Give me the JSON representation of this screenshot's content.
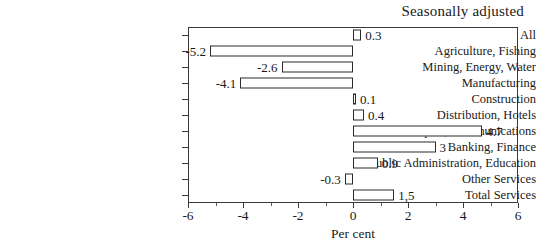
{
  "chart_data": {
    "type": "bar",
    "orientation": "horizontal",
    "title": "Seasonally adjusted",
    "xlabel": "Per cent",
    "ylabel": "",
    "xlim": [
      -6,
      6
    ],
    "grid": false,
    "legend": null,
    "xticks": [
      -6,
      -4,
      -2,
      0,
      2,
      4,
      6
    ],
    "xtick_labels": [
      "-6",
      "-4",
      "-2",
      "0",
      "2",
      "4",
      "6"
    ],
    "xticks_minor": [
      -5,
      -3,
      -1,
      1,
      3,
      5
    ],
    "categories": [
      "All",
      "Agriculture, Fishing",
      "Mining, Energy, Water",
      "Manufacturing",
      "Construction",
      "Distribution, Hotels",
      "Transport, Communications",
      "Banking, Finance",
      "Public Administration, Education",
      "Other Services",
      "Total Services"
    ],
    "values": [
      0.3,
      -5.2,
      -2.6,
      -4.1,
      0.1,
      0.4,
      4.7,
      3,
      0.9,
      -0.3,
      1.5
    ],
    "value_labels": [
      "0.3",
      "-5.2",
      "-2.6",
      "-4.1",
      "0.1",
      "0.4",
      "4.7",
      "3",
      "0.9",
      "-0.3",
      "1,5"
    ],
    "bar_facecolor": "#ffffff",
    "bar_edgecolor": "#2b2b2b"
  }
}
